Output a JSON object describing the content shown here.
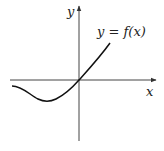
{
  "diagram": {
    "type": "function-graph",
    "axes": {
      "x_label": "x",
      "y_label": "y",
      "color": "#333333"
    },
    "curve": {
      "label": "y = f(x)",
      "color": "#111111",
      "description": "Curve starts slightly below x-axis on the left, dips to a local minimum in the third quadrant, rises through the origin, and continues increasing into the first quadrant."
    }
  }
}
